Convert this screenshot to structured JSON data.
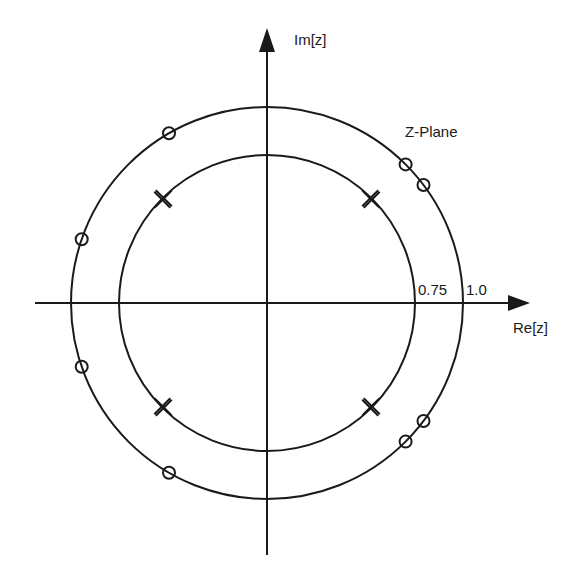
{
  "diagram": {
    "title": "Z-Plane",
    "axes": {
      "x_label": "Re[z]",
      "y_label": "Im[z]"
    },
    "circles": [
      {
        "name": "inner-circle",
        "radius_value": 0.75,
        "label": "0.75"
      },
      {
        "name": "outer-circle",
        "radius_value": 1.0,
        "label": "1.0"
      }
    ],
    "poles": {
      "marker": "x",
      "multiplicity": 2,
      "radius": 0.75,
      "angles_deg": [
        45,
        135,
        225,
        315
      ]
    },
    "zeros": {
      "marker": "o",
      "radius": 1.0,
      "angles_deg": [
        37,
        45,
        120,
        161,
        199,
        240,
        315,
        323
      ]
    },
    "colors": {
      "ink": "#1a1a1a",
      "background": "#ffffff"
    }
  }
}
